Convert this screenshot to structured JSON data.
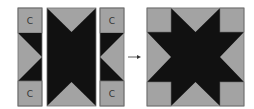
{
  "diagram": {
    "labels": {
      "left_top": "C",
      "left_bottom": "C",
      "right_top": "C",
      "right_bottom": "C"
    },
    "arrow": "right-arrow",
    "colors": {
      "light": "#a3a3a3",
      "dark": "#111111",
      "border": "#6e6e6e"
    }
  }
}
